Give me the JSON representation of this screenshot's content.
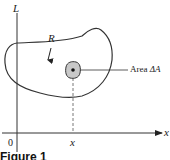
{
  "diagram": {
    "axes": {
      "vertical_label": "L",
      "horizontal_label": "x",
      "origin_label": "0",
      "x_tick_label": "x"
    },
    "region": {
      "label": "R"
    },
    "element": {
      "label": "Area ΔA",
      "label_prefix": "Area",
      "label_symbol": "ΔA"
    },
    "caption": "Figure 1"
  },
  "colors": {
    "line": "#333333",
    "shading": "#c8c8c8",
    "background": "#ffffff"
  }
}
